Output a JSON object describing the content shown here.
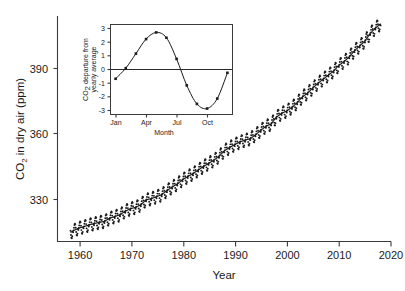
{
  "chart_data": {
    "type": "scatter",
    "title": "",
    "xlabel": "Year",
    "ylabel": "CO2 in dry air (ppm)",
    "ylabel_parts": {
      "pre": "CO",
      "sub": "2",
      "post": " in dry air (ppm)"
    },
    "xlim": [
      1956,
      2020
    ],
    "ylim": [
      311,
      412
    ],
    "xticks": [
      1960,
      1970,
      1980,
      1990,
      2000,
      2010,
      2020
    ],
    "xtick_labels": [
      "1960",
      "1970",
      "1980",
      "1990",
      "2000",
      "2010",
      "2020"
    ],
    "yticks": [
      330,
      360,
      390
    ],
    "ytick_labels": [
      "330",
      "360",
      "390"
    ],
    "grid": false,
    "legend": "none",
    "marker": "small-dot",
    "series": [
      {
        "name": "Monthly mean CO2",
        "note": "monthly observations plotted as small dots with seasonal oscillation of about +/- 3 ppm about the trend",
        "seasonal_amplitude_ppm": 3.0,
        "x": [
          1958.5,
          1959,
          1960,
          1961,
          1962,
          1963,
          1964,
          1965,
          1966,
          1967,
          1968,
          1969,
          1970,
          1971,
          1972,
          1973,
          1974,
          1975,
          1976,
          1977,
          1978,
          1979,
          1980,
          1981,
          1982,
          1983,
          1984,
          1985,
          1986,
          1987,
          1988,
          1989,
          1990,
          1991,
          1992,
          1993,
          1994,
          1995,
          1996,
          1997,
          1998,
          1999,
          2000,
          2001,
          2002,
          2003,
          2004,
          2005,
          2006,
          2007,
          2008,
          2009,
          2010,
          2011,
          2012,
          2013,
          2014,
          2015,
          2016,
          2017,
          2018
        ],
        "y": [
          315.0,
          315.8,
          316.9,
          317.6,
          318.4,
          319.0,
          319.6,
          320.0,
          321.4,
          322.2,
          323.0,
          324.6,
          325.7,
          326.3,
          327.5,
          329.7,
          330.2,
          331.1,
          332.0,
          333.8,
          335.4,
          336.8,
          338.7,
          340.1,
          341.4,
          343.0,
          344.6,
          346.0,
          347.4,
          349.2,
          351.6,
          353.1,
          354.4,
          355.6,
          356.4,
          357.1,
          358.8,
          360.8,
          362.6,
          363.7,
          366.7,
          368.4,
          369.5,
          371.1,
          373.2,
          375.8,
          377.5,
          379.8,
          381.9,
          383.8,
          385.6,
          387.4,
          389.9,
          391.6,
          393.8,
          396.5,
          398.6,
          400.8,
          404.2,
          406.6,
          408.5
        ]
      },
      {
        "name": "Smooth trend (seasonally adjusted)",
        "note": "solid line drawn through the monthly dots"
      }
    ],
    "inset": {
      "type": "line",
      "title": "",
      "xlabel": "Month",
      "ylabel": "CO2 departure from yearly average",
      "ylabel_parts": {
        "pre": "CO",
        "sub": "2",
        "post": " departure from"
      },
      "ylabel_line2": "yearly average",
      "xlim": [
        0.5,
        12.5
      ],
      "ylim": [
        -3.4,
        3.4
      ],
      "xticks": [
        1,
        4,
        7,
        10
      ],
      "xtick_labels": [
        "Jan",
        "Apr",
        "Jul",
        "Oct"
      ],
      "yticks": [
        -3,
        -2,
        -1,
        0,
        1,
        2,
        3
      ],
      "ytick_labels": [
        "-3",
        "-2",
        "-1",
        "0",
        "1",
        "2",
        "3"
      ],
      "zero_line": true,
      "grid": false,
      "marker": "filled-square",
      "months": [
        "Jan",
        "Feb",
        "Mar",
        "Apr",
        "May",
        "Jun",
        "Jul",
        "Aug",
        "Sep",
        "Oct",
        "Nov",
        "Dec"
      ],
      "values": [
        -0.7,
        0.1,
        1.2,
        2.3,
        2.8,
        2.4,
        0.8,
        -1.2,
        -2.6,
        -2.95,
        -2.2,
        -0.25
      ]
    }
  },
  "figure": {
    "background_color": "#ffffff",
    "axis_color": "#3a3a3a",
    "data_color": "#1a1a1a"
  }
}
